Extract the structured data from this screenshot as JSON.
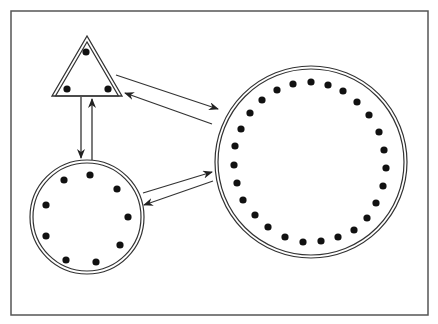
{
  "diagram": {
    "type": "network-topology",
    "colors": {
      "background": "#ffffff",
      "stroke": "#333333",
      "dot": "#111111",
      "frame": "#555555"
    },
    "frame": {
      "x": 11,
      "y": 11,
      "width": 417,
      "height": 304
    },
    "nodes": [
      {
        "id": "triangle",
        "shape": "triangle",
        "points": [
          [
            87,
            36
          ],
          [
            52,
            96
          ],
          [
            122,
            96
          ]
        ],
        "dot_count": 3,
        "dots": [
          [
            86,
            52
          ],
          [
            67,
            89
          ],
          [
            108,
            89
          ]
        ]
      },
      {
        "id": "small-circle",
        "shape": "circle",
        "cx": 87,
        "cy": 217,
        "r_outer": 57,
        "r_inner": 54,
        "dot_count": 9,
        "dots": [
          [
            64,
            180
          ],
          [
            90,
            175
          ],
          [
            117,
            189
          ],
          [
            128,
            217
          ],
          [
            120,
            245
          ],
          [
            96,
            262
          ],
          [
            66,
            260
          ],
          [
            46,
            236
          ],
          [
            46,
            205
          ]
        ]
      },
      {
        "id": "large-circle",
        "shape": "circle",
        "cx": 311,
        "cy": 162,
        "r_outer": 96,
        "r_inner": 93,
        "dot_count": 28,
        "dots": [
          [
            311,
            82
          ],
          [
            328,
            85
          ],
          [
            343,
            91
          ],
          [
            357,
            102
          ],
          [
            369,
            115
          ],
          [
            379,
            132
          ],
          [
            384,
            150
          ],
          [
            386,
            168
          ],
          [
            383,
            186
          ],
          [
            376,
            203
          ],
          [
            367,
            218
          ],
          [
            354,
            230
          ],
          [
            338,
            237
          ],
          [
            321,
            241
          ],
          [
            303,
            242
          ],
          [
            285,
            237
          ],
          [
            268,
            227
          ],
          [
            255,
            215
          ],
          [
            243,
            200
          ],
          [
            237,
            183
          ],
          [
            234,
            165
          ],
          [
            235,
            146
          ],
          [
            241,
            129
          ],
          [
            250,
            113
          ],
          [
            262,
            100
          ],
          [
            277,
            90
          ],
          [
            293,
            84
          ]
        ]
      }
    ],
    "edges": [
      {
        "from": "triangle",
        "to": "small-circle",
        "x1": 81,
        "y1": 97,
        "x2": 81,
        "y2": 158
      },
      {
        "from": "small-circle",
        "to": "triangle",
        "x1": 92,
        "y1": 160,
        "x2": 92,
        "y2": 99
      },
      {
        "from": "triangle",
        "to": "large-circle",
        "x1": 116,
        "y1": 75,
        "x2": 218,
        "y2": 109
      },
      {
        "from": "large-circle",
        "to": "triangle",
        "x1": 212,
        "y1": 124,
        "x2": 125,
        "y2": 93
      },
      {
        "from": "small-circle",
        "to": "large-circle",
        "x1": 143,
        "y1": 193,
        "x2": 212,
        "y2": 172
      },
      {
        "from": "large-circle",
        "to": "small-circle",
        "x1": 213,
        "y1": 181,
        "x2": 144,
        "y2": 205
      }
    ]
  }
}
